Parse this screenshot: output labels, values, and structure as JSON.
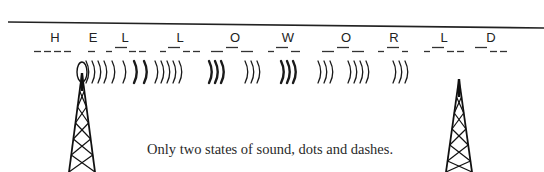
{
  "diagram": {
    "title_rule": {
      "x1": 8,
      "y1": 22,
      "x2": 544,
      "y2": 28
    },
    "message": "HELLO WORLD",
    "letters": [
      {
        "char": "H",
        "x": 55,
        "code": [
          {
            "t": "dash",
            "x": 34,
            "w": 7
          },
          {
            "t": "dash",
            "x": 44,
            "w": 7
          },
          {
            "t": "dash",
            "x": 54,
            "w": 7
          },
          {
            "t": "dash",
            "x": 64,
            "w": 7
          }
        ]
      },
      {
        "char": "E",
        "x": 93,
        "code": [
          {
            "t": "dash",
            "x": 88,
            "w": 7
          }
        ]
      },
      {
        "char": "L",
        "x": 125,
        "code": [
          {
            "t": "dash",
            "x": 106,
            "w": 6
          },
          {
            "t": "dot",
            "x": 115,
            "w": 12
          },
          {
            "t": "dash",
            "x": 129,
            "w": 7
          },
          {
            "t": "dash",
            "x": 139,
            "w": 7
          }
        ]
      },
      {
        "char": "L",
        "x": 180,
        "code": [
          {
            "t": "dash",
            "x": 160,
            "w": 6
          },
          {
            "t": "dot",
            "x": 168,
            "w": 12
          },
          {
            "t": "dash",
            "x": 183,
            "w": 7
          },
          {
            "t": "dash",
            "x": 193,
            "w": 7
          }
        ]
      },
      {
        "char": "O",
        "x": 235,
        "code": [
          {
            "t": "dash",
            "x": 211,
            "w": 12
          },
          {
            "t": "dot",
            "x": 226,
            "w": 12
          },
          {
            "t": "dash",
            "x": 241,
            "w": 12
          }
        ]
      },
      {
        "char": "W",
        "x": 288,
        "code": [
          {
            "t": "dash",
            "x": 268,
            "w": 6
          },
          {
            "t": "dot",
            "x": 276,
            "w": 12
          },
          {
            "t": "dash",
            "x": 291,
            "w": 9
          }
        ]
      },
      {
        "char": "O",
        "x": 346,
        "code": [
          {
            "t": "dash",
            "x": 322,
            "w": 12
          },
          {
            "t": "dot",
            "x": 337,
            "w": 12
          },
          {
            "t": "dash",
            "x": 352,
            "w": 12
          }
        ]
      },
      {
        "char": "R",
        "x": 394,
        "code": [
          {
            "t": "dash",
            "x": 378,
            "w": 6
          },
          {
            "t": "dot",
            "x": 387,
            "w": 12
          },
          {
            "t": "dash",
            "x": 402,
            "w": 6
          }
        ]
      },
      {
        "char": "L",
        "x": 444,
        "code": [
          {
            "t": "dash",
            "x": 424,
            "w": 6
          },
          {
            "t": "dot",
            "x": 432,
            "w": 12
          },
          {
            "t": "dash",
            "x": 447,
            "w": 7
          },
          {
            "t": "dash",
            "x": 457,
            "w": 7
          }
        ]
      },
      {
        "char": "D",
        "x": 491,
        "code": [
          {
            "t": "dot",
            "x": 475,
            "w": 12
          },
          {
            "t": "dash",
            "x": 490,
            "w": 7
          },
          {
            "t": "dash",
            "x": 500,
            "w": 7
          }
        ]
      }
    ],
    "waves": {
      "groups": [
        {
          "x": [
            86,
            92,
            98,
            104
          ],
          "weight": "thin"
        },
        {
          "x": [
            112,
            123
          ],
          "weight": "thin"
        },
        {
          "x": [
            134,
            144
          ],
          "weight": "bold"
        },
        {
          "x": [
            155,
            161,
            167,
            173,
            179
          ],
          "weight": "thin"
        },
        {
          "x": [
            209,
            215,
            221
          ],
          "weight": "bold"
        },
        {
          "x": [
            245,
            251,
            257
          ],
          "weight": "thin"
        },
        {
          "x": [
            281,
            287,
            293
          ],
          "weight": "bold"
        },
        {
          "x": [
            318,
            324,
            330
          ],
          "weight": "thin"
        },
        {
          "x": [
            348,
            354,
            360,
            366
          ],
          "weight": "thin"
        },
        {
          "x": [
            393,
            399,
            405
          ],
          "weight": "thin"
        }
      ],
      "y_center": 72
    },
    "towers": [
      {
        "name": "transmitter",
        "x": 82,
        "top": 73,
        "ring": true
      },
      {
        "name": "receiver",
        "x": 459,
        "top": 79,
        "ring": false
      }
    ],
    "caption": "Only two states of sound, dots and dashes."
  }
}
